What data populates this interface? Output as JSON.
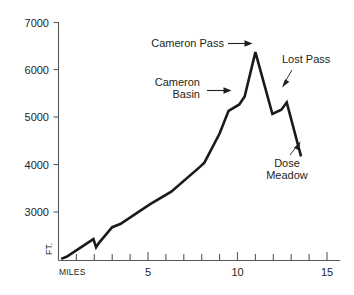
{
  "chart_data": {
    "type": "line",
    "title": "",
    "subtitle": "",
    "xlabel": "MILES",
    "ylabel": "FT.",
    "xlim": [
      0,
      15.6
    ],
    "ylim": [
      2500,
      7000
    ],
    "grid": false,
    "legend": null,
    "x_ticks_major": [
      5,
      10,
      15
    ],
    "x_tick_labels": [
      "5",
      "10",
      "15"
    ],
    "x_ticks_minor": [
      1,
      2,
      3,
      4,
      6,
      7,
      8,
      9,
      11,
      12,
      13,
      14
    ],
    "y_ticks": [
      3000,
      4000,
      5000,
      6000,
      7000
    ],
    "y_tick_labels": [
      "3000",
      "4000",
      "5000",
      "6000",
      "7000"
    ],
    "series": [
      {
        "name": "Trail elevation profile",
        "x": [
          0.15,
          0.45,
          1.95,
          2.1,
          2.25,
          3.0,
          3.45,
          5.1,
          6.3,
          7.9,
          8.15,
          9.0,
          9.5,
          10.1,
          10.4,
          11.0,
          11.95,
          12.45,
          12.75,
          13.55
        ],
        "y": [
          2530,
          2570,
          2905,
          2750,
          2830,
          3130,
          3190,
          3560,
          3800,
          4270,
          4350,
          4900,
          5330,
          5450,
          5600,
          6440,
          5270,
          5350,
          5490,
          4470
        ]
      }
    ],
    "annotations": [
      {
        "name": "cameron-pass",
        "lines": [
          "Cameron Pass"
        ],
        "text": "Cameron Pass",
        "align": "right",
        "arrow": "right-horizontal"
      },
      {
        "name": "cameron-basin",
        "lines": [
          "Cameron",
          "Basin"
        ],
        "text": "Cameron Basin",
        "align": "right",
        "arrow": "right-horizontal"
      },
      {
        "name": "lost-pass",
        "lines": [
          "Lost Pass"
        ],
        "text": "Lost Pass",
        "align": "left",
        "arrow": "down-left-diagonal"
      },
      {
        "name": "dose-meadow",
        "lines": [
          "Dose",
          "Meadow"
        ],
        "text": "Dose Meadow",
        "align": "center",
        "arrow": "up-right-diagonal"
      }
    ],
    "colors": {
      "line": "#1a1a1a",
      "axis": "#58595b",
      "text": "#231f20",
      "background": "#ffffff"
    }
  },
  "axis": {
    "y_labels": {
      "t7000": "7000",
      "t6000": "6000",
      "t5000": "5000",
      "t4000": "4000",
      "t3000": "3000"
    },
    "x_labels": {
      "t5": "5",
      "t10": "10",
      "t15": "15"
    },
    "unit_x": "MILES",
    "unit_y": "FT."
  },
  "annotations": {
    "cameron_pass": "Cameron Pass",
    "cameron_basin_line1": "Cameron",
    "cameron_basin_line2": "Basin",
    "lost_pass": "Lost Pass",
    "dose_meadow_line1": "Dose",
    "dose_meadow_line2": "Meadow"
  }
}
